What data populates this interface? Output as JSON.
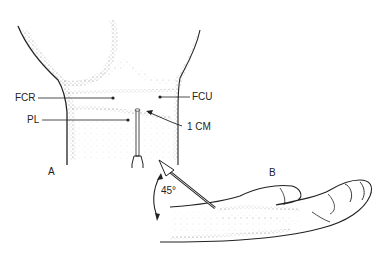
{
  "figure": {
    "panel_a": {
      "label": "A",
      "annotations": [
        {
          "id": "fcr",
          "text": "FCR"
        },
        {
          "id": "fcu",
          "text": "FCU"
        },
        {
          "id": "pl",
          "text": "PL"
        },
        {
          "id": "distance",
          "text": "1 CM"
        }
      ]
    },
    "panel_b": {
      "label": "B",
      "angle_label": "45°"
    },
    "colors": {
      "ink": "#222222",
      "background": "#ffffff"
    }
  }
}
